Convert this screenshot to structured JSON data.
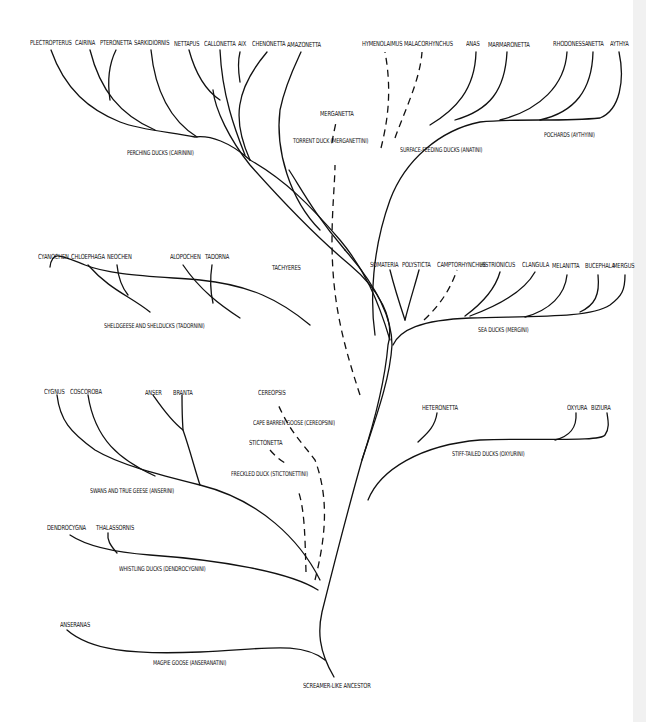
{
  "diagram": {
    "title": "",
    "root": "SCREAMER-LIKE ANCESTOR",
    "genera": {
      "perching": [
        "PLECTROPTERUS",
        "CAIRINA",
        "PTERONETTA",
        "SARKIDIORNIS",
        "NETTAPUS",
        "CALLONETTA",
        "AIX",
        "CHENONETTA",
        "AMAZONETTA"
      ],
      "torrent": [
        "MERGANETTA"
      ],
      "surface": [
        "HYMENOLAIMUS",
        "MALACORHYNCHUS",
        "ANAS",
        "MARMARONETTA"
      ],
      "pochards": [
        "RHODONESSA",
        "NETTA",
        "AYTHYA"
      ],
      "shelgeese": [
        "CYANOCHEN",
        "CHLOEPHAGA",
        "NEOCHEN",
        "ALOPOCHEN",
        "TADORNA"
      ],
      "steamer": [
        "TACHYERES"
      ],
      "sea": [
        "SOMATERIA",
        "POLYSTICTA",
        "CAMPTORHYNCHUS",
        "HISTRIONICUS",
        "CLANGULA",
        "MELANITTA",
        "BUCEPHALA",
        "MERGUS"
      ],
      "swans": [
        "CYGNUS",
        "COSCOROBA",
        "ANSER",
        "BRANTA"
      ],
      "capebarren": [
        "CEREOPSIS"
      ],
      "freckled": [
        "STICTONETTA"
      ],
      "stiff": [
        "HETERONETTA",
        "OXYURA",
        "BIZIURA"
      ],
      "whistling": [
        "DENDROCYGNA",
        "THALASSORNIS"
      ],
      "magpie": [
        "ANSERANAS"
      ]
    },
    "tribes": {
      "perching": "PERCHING DUCKS (CAIRININI)",
      "torrent": "TORRENT DUCK (MERGANETTINI)",
      "surface": "SURFACE-FEEDING DUCKS (ANATINI)",
      "pochards": "POCHARDS (AYTHYINI)",
      "shelgeese": "SHELDGEESE AND SHELDUCKS (TADORNINI)",
      "sea": "SEA DUCKS (MERGINI)",
      "capebarren": "CAPE BARREN GOOSE (CEREOPSINI)",
      "freckled": "FRECKLED DUCK (STICTONETTINI)",
      "stiff": "STIFF-TAILED DUCKS (OXYURINI)",
      "swans": "SWANS AND TRUE GEESE (ANSERINI)",
      "whistling": "WHISTLING DUCKS (DENDROCYGNINI)",
      "magpie": "MAGPIE GOOSE (ANSERANATINI)"
    },
    "colors": {
      "line": "#111111",
      "background": "#ffffff",
      "edge_strip": "#f1f1f1"
    }
  }
}
